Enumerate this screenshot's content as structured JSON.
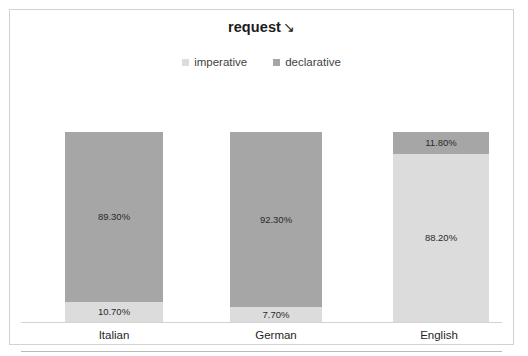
{
  "chart": {
    "title": "request",
    "title_arrow": "↘",
    "background_color": "#ffffff",
    "border_color": "#d2d2d2"
  },
  "legend": {
    "position": "top",
    "items": [
      {
        "label": "imperative",
        "color": "#dcdcdc"
      },
      {
        "label": "declarative",
        "color": "#a6a6a6"
      }
    ]
  },
  "axis": {
    "categories": [
      "Italian",
      "German",
      "English"
    ]
  },
  "chart_data": {
    "type": "bar",
    "subtype": "stacked-100-percent",
    "xlabel": "",
    "ylabel": "",
    "ylim": [
      0,
      100
    ],
    "grid": false,
    "legend_position": "top",
    "categories": [
      "Italian",
      "German",
      "English"
    ],
    "series": [
      {
        "name": "imperative",
        "color": "#dcdcdc",
        "values": [
          10.7,
          7.7,
          88.2
        ],
        "labels": [
          "10.70%",
          "7.70%",
          "88.20%"
        ]
      },
      {
        "name": "declarative",
        "color": "#a6a6a6",
        "values": [
          89.3,
          92.3,
          11.8
        ],
        "labels": [
          "89.30%",
          "92.30%",
          "11.80%"
        ]
      }
    ]
  }
}
